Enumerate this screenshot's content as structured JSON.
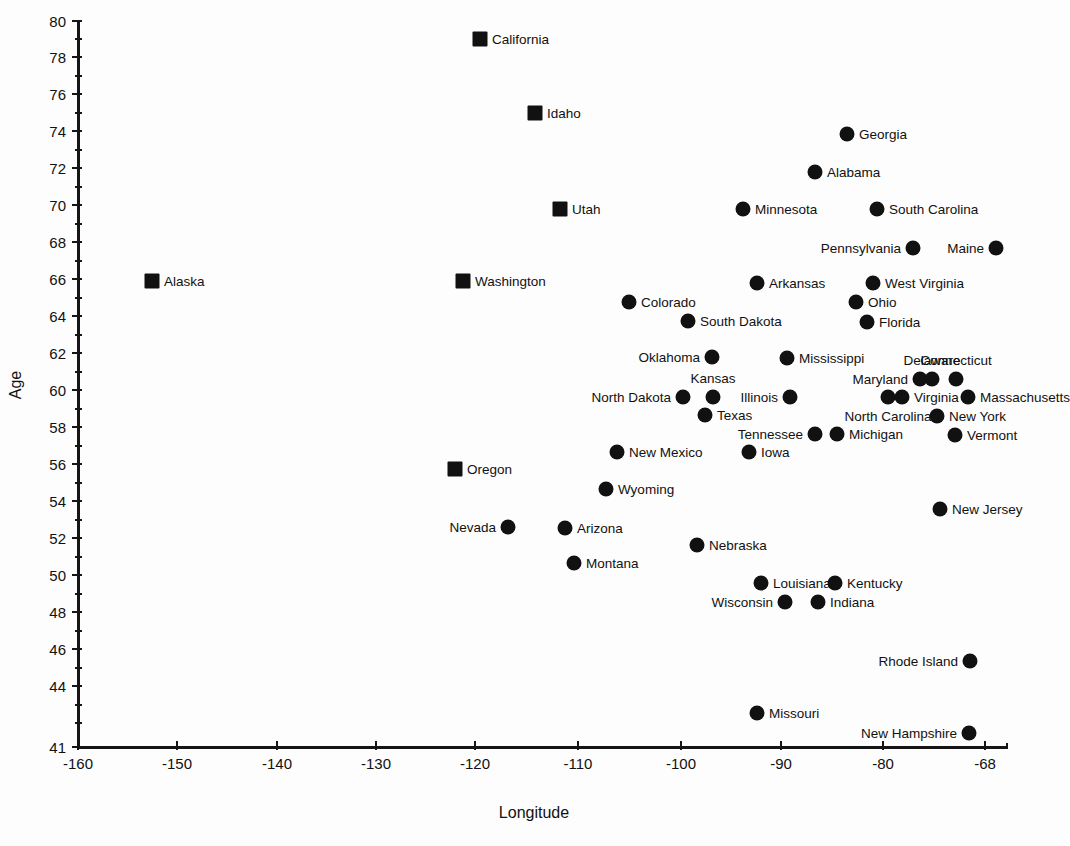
{
  "chart_data": {
    "type": "scatter",
    "title": "",
    "xlabel": "Longitude",
    "ylabel": "Age",
    "xlim": [
      -160,
      -68
    ],
    "ylim": [
      41,
      80
    ],
    "grid": false,
    "legend": "none",
    "x_ticks": [
      "-160",
      "-150",
      "-140",
      "-130",
      "-120",
      "-110",
      "-100",
      "-90",
      "-80",
      "-68"
    ],
    "x_tick_values": [
      -160,
      -150,
      -140,
      -130,
      -120,
      -110,
      -100,
      -90,
      -80,
      -68
    ],
    "y_ticks": [
      "80",
      "78",
      "76",
      "74",
      "72",
      "70",
      "68",
      "66",
      "64",
      "62",
      "60",
      "58",
      "56",
      "54",
      "52",
      "50",
      "48",
      "46",
      "44",
      "41"
    ],
    "y_tick_values": [
      80,
      78,
      76,
      74,
      72,
      70,
      68,
      66,
      64,
      62,
      60,
      58,
      56,
      54,
      52,
      50,
      48,
      46,
      44,
      41
    ],
    "marker_shapes": [
      "square",
      "circle"
    ],
    "marker_color": "#111111",
    "points": [
      {
        "label": "California",
        "x": -121.0,
        "y": 79.0,
        "shape": "square",
        "label_side": "right",
        "px": 480,
        "py": 39
      },
      {
        "label": "Idaho",
        "x": -115.5,
        "y": 75.0,
        "shape": "square",
        "label_side": "right",
        "px": 535,
        "py": 113
      },
      {
        "label": "Georgia",
        "x": -83.0,
        "y": 73.8,
        "shape": "circle",
        "label_side": "right",
        "px": 847,
        "py": 134
      },
      {
        "label": "Alabama",
        "x": -86.3,
        "y": 71.9,
        "shape": "circle",
        "label_side": "right",
        "px": 815,
        "py": 172
      },
      {
        "label": "Utah",
        "x": -113.0,
        "y": 70.0,
        "shape": "square",
        "label_side": "right",
        "px": 560,
        "py": 209
      },
      {
        "label": "Minnesota",
        "x": -126.0,
        "y": 69.9,
        "shape": "circle",
        "label_side": "right",
        "px": 743,
        "py": 209
      },
      {
        "label": "South Carolina",
        "x": -82.4,
        "y": 69.9,
        "shape": "circle",
        "label_side": "right",
        "px": 877,
        "py": 209
      },
      {
        "label": "Pennsylvania",
        "x": -78.8,
        "y": 68.0,
        "shape": "circle",
        "label_side": "left",
        "px": 913,
        "py": 248
      },
      {
        "label": "Maine",
        "x": -70.5,
        "y": 68.0,
        "shape": "circle",
        "label_side": "left",
        "px": 996,
        "py": 248
      },
      {
        "label": "Alaska",
        "x": -152.6,
        "y": 66.0,
        "shape": "square",
        "label_side": "right",
        "px": 152,
        "py": 281
      },
      {
        "label": "Washington",
        "x": -121.4,
        "y": 66.0,
        "shape": "square",
        "label_side": "right",
        "px": 463,
        "py": 281
      },
      {
        "label": "Arkansas",
        "x": -92.2,
        "y": 65.9,
        "shape": "circle",
        "label_side": "right",
        "px": 757,
        "py": 283
      },
      {
        "label": "West Virginia",
        "x": -80.6,
        "y": 65.9,
        "shape": "circle",
        "label_side": "right",
        "px": 873,
        "py": 283
      },
      {
        "label": "Colorado",
        "x": -104.9,
        "y": 64.9,
        "shape": "circle",
        "label_side": "right",
        "px": 629,
        "py": 302
      },
      {
        "label": "Ohio",
        "x": -82.3,
        "y": 64.9,
        "shape": "circle",
        "label_side": "right",
        "px": 856,
        "py": 302
      },
      {
        "label": "South Dakota",
        "x": -99.0,
        "y": 63.9,
        "shape": "circle",
        "label_side": "right",
        "px": 688,
        "py": 321
      },
      {
        "label": "Florida",
        "x": -81.4,
        "y": 63.8,
        "shape": "circle",
        "label_side": "right",
        "px": 867,
        "py": 322
      },
      {
        "label": "Oklahoma",
        "x": -96.6,
        "y": 61.9,
        "shape": "circle",
        "label_side": "left",
        "px": 712,
        "py": 357
      },
      {
        "label": "Mississippi",
        "x": -89.1,
        "y": 61.9,
        "shape": "circle",
        "label_side": "right",
        "px": 787,
        "py": 358
      },
      {
        "label": "Maryland",
        "x": -76.6,
        "y": 60.9,
        "shape": "circle",
        "label_side": "left",
        "px": 920,
        "py": 379
      },
      {
        "label": "Delaware",
        "x": -75.4,
        "y": 60.9,
        "shape": "circle",
        "label_side": "top",
        "px": 932,
        "py": 379
      },
      {
        "label": "Connecticut",
        "x": -73.0,
        "y": 60.9,
        "shape": "circle",
        "label_side": "top",
        "px": 956,
        "py": 379
      },
      {
        "label": "North Dakota",
        "x": -100.3,
        "y": 59.9,
        "shape": "circle",
        "label_side": "left",
        "px": 683,
        "py": 397
      },
      {
        "label": "Kansas",
        "x": -97.3,
        "y": 59.9,
        "shape": "circle",
        "label_side": "top",
        "px": 713,
        "py": 397
      },
      {
        "label": "Illinois",
        "x": -89.6,
        "y": 59.9,
        "shape": "circle",
        "label_side": "left",
        "px": 790,
        "py": 397
      },
      {
        "label": "North Carolina",
        "x": -79.8,
        "y": 59.9,
        "shape": "circle",
        "label_side": "bottom",
        "px": 888,
        "py": 397
      },
      {
        "label": "Virginia",
        "x": -78.4,
        "y": 59.9,
        "shape": "circle",
        "label_side": "right",
        "px": 902,
        "py": 397
      },
      {
        "label": "Massachusetts",
        "x": -71.8,
        "y": 59.9,
        "shape": "circle",
        "label_side": "right",
        "px": 968,
        "py": 397
      },
      {
        "label": "Texas",
        "x": -97.9,
        "y": 58.8,
        "shape": "circle",
        "label_side": "right",
        "px": 705,
        "py": 415
      },
      {
        "label": "New York",
        "x": -74.7,
        "y": 58.8,
        "shape": "circle",
        "label_side": "right",
        "px": 937,
        "py": 416
      },
      {
        "label": "Tennessee",
        "x": -86.6,
        "y": 57.8,
        "shape": "circle",
        "label_side": "left",
        "px": 815,
        "py": 434
      },
      {
        "label": "Michigan",
        "x": -84.4,
        "y": 57.8,
        "shape": "circle",
        "label_side": "right",
        "px": 837,
        "py": 434
      },
      {
        "label": "Vermont",
        "x": -72.9,
        "y": 57.8,
        "shape": "circle",
        "label_side": "right",
        "px": 955,
        "py": 435
      },
      {
        "label": "New Mexico",
        "x": -106.2,
        "y": 56.9,
        "shape": "circle",
        "label_side": "right",
        "px": 617,
        "py": 452
      },
      {
        "label": "Iowa",
        "x": -93.0,
        "y": 56.9,
        "shape": "circle",
        "label_side": "right",
        "px": 749,
        "py": 452
      },
      {
        "label": "Oregon",
        "x": -122.4,
        "y": 56.0,
        "shape": "square",
        "label_side": "right",
        "px": 455,
        "py": 469
      },
      {
        "label": "Wyoming",
        "x": -107.3,
        "y": 54.9,
        "shape": "circle",
        "label_side": "right",
        "px": 606,
        "py": 489
      },
      {
        "label": "New Jersey",
        "x": -74.4,
        "y": 53.8,
        "shape": "circle",
        "label_side": "right",
        "px": 940,
        "py": 509
      },
      {
        "label": "Nevada",
        "x": -116.1,
        "y": 52.9,
        "shape": "circle",
        "label_side": "left",
        "px": 508,
        "py": 527
      },
      {
        "label": "Arizona",
        "x": -110.4,
        "y": 52.9,
        "shape": "circle",
        "label_side": "right",
        "px": 565,
        "py": 528
      },
      {
        "label": "Nebraska",
        "x": -97.2,
        "y": 51.9,
        "shape": "circle",
        "label_side": "right",
        "px": 697,
        "py": 545
      },
      {
        "label": "Montana",
        "x": -109.5,
        "y": 50.9,
        "shape": "circle",
        "label_side": "right",
        "px": 574,
        "py": 563
      },
      {
        "label": "Louisiana",
        "x": -91.4,
        "y": 49.9,
        "shape": "circle",
        "label_side": "right",
        "px": 761,
        "py": 583
      },
      {
        "label": "Kentucky",
        "x": -84.0,
        "y": 49.9,
        "shape": "circle",
        "label_side": "right",
        "px": 835,
        "py": 583
      },
      {
        "label": "Wisconsin",
        "x": -89.0,
        "y": 48.8,
        "shape": "circle",
        "label_side": "left",
        "px": 785,
        "py": 602
      },
      {
        "label": "Indiana",
        "x": -85.7,
        "y": 48.8,
        "shape": "circle",
        "label_side": "right",
        "px": 818,
        "py": 602
      },
      {
        "label": "Rhode Island",
        "x": -71.5,
        "y": 45.8,
        "shape": "circle",
        "label_side": "left",
        "px": 970,
        "py": 661
      },
      {
        "label": "Missouri",
        "x": -92.3,
        "y": 43.0,
        "shape": "circle",
        "label_side": "right",
        "px": 757,
        "py": 713
      },
      {
        "label": "New Hampshire",
        "x": -71.6,
        "y": 41.9,
        "shape": "circle",
        "label_side": "left",
        "px": 969,
        "py": 733
      }
    ]
  },
  "axes": {
    "x": {
      "title": "Longitude",
      "ticks": [
        {
          "label": "-160",
          "px": 78
        },
        {
          "label": "-150",
          "px": 177
        },
        {
          "label": "-140",
          "px": 277
        },
        {
          "label": "-130",
          "px": 376
        },
        {
          "label": "-120",
          "px": 475
        },
        {
          "label": "-110",
          "px": 578
        },
        {
          "label": "-100",
          "px": 681
        },
        {
          "label": "-90",
          "px": 781
        },
        {
          "label": "-80",
          "px": 883
        },
        {
          "label": "-68",
          "px": 985
        }
      ],
      "minor_px": [
        1007
      ]
    },
    "y": {
      "title": "Age",
      "ticks": [
        {
          "label": "80",
          "px": 21
        },
        {
          "label": "78",
          "px": 57
        },
        {
          "label": "76",
          "px": 94
        },
        {
          "label": "74",
          "px": 131
        },
        {
          "label": "72",
          "px": 168
        },
        {
          "label": "70",
          "px": 205
        },
        {
          "label": "68",
          "px": 242
        },
        {
          "label": "66",
          "px": 279
        },
        {
          "label": "64",
          "px": 316
        },
        {
          "label": "62",
          "px": 353
        },
        {
          "label": "60",
          "px": 390
        },
        {
          "label": "58",
          "px": 427
        },
        {
          "label": "56",
          "px": 464
        },
        {
          "label": "54",
          "px": 501
        },
        {
          "label": "52",
          "px": 538
        },
        {
          "label": "50",
          "px": 575
        },
        {
          "label": "48",
          "px": 612
        },
        {
          "label": "46",
          "px": 649
        },
        {
          "label": "44",
          "px": 686
        },
        {
          "label": "41",
          "px": 747
        }
      ],
      "minor_px": [
        39,
        76,
        113,
        150,
        187,
        224,
        261,
        298,
        335,
        372,
        409,
        446,
        483,
        520,
        557,
        594,
        631,
        668,
        705,
        723
      ]
    }
  }
}
